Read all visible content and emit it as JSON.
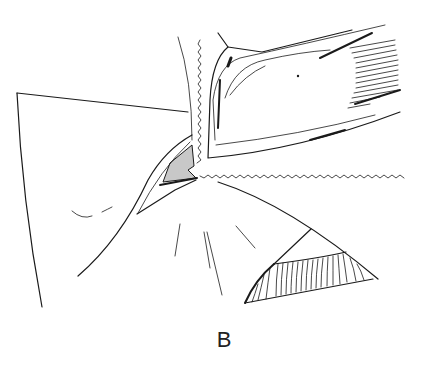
{
  "figure": {
    "label": "B",
    "type": "surgical line illustration",
    "colors": {
      "ink": "#1a1a1a",
      "shaded_region": "#c8c8c8",
      "background": "#ffffff"
    }
  }
}
